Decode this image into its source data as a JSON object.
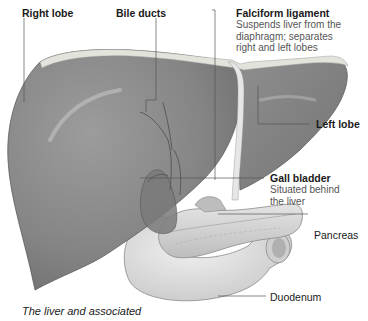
{
  "figure": {
    "caption": "The liver and associated",
    "colors": {
      "liver": "#8a8a8a",
      "liver_dark": "#6a6a6a",
      "liver_highlight": "#c4c4c4",
      "capsule": "#dcdcd6",
      "pancreas": "#d6d6d6",
      "duodenum": "#e2e2e2",
      "leader_line": "#555555",
      "text": "#1a1a1a",
      "subtext": "#555555"
    }
  },
  "labels": {
    "right_lobe": {
      "title": "Right lobe"
    },
    "bile_ducts": {
      "title": "Bile ducts"
    },
    "falciform": {
      "title": "Falciform ligament",
      "desc_lines": [
        "Suspends liver from the",
        "diaphragm; separates",
        "right and left lobes"
      ]
    },
    "left_lobe": {
      "title": "Left lobe"
    },
    "gall_bladder": {
      "title": "Gall bladder",
      "desc_lines": [
        "Situated behind",
        "the liver"
      ]
    },
    "pancreas": {
      "title": "Pancreas"
    },
    "duodenum": {
      "title": "Duodenum"
    }
  }
}
